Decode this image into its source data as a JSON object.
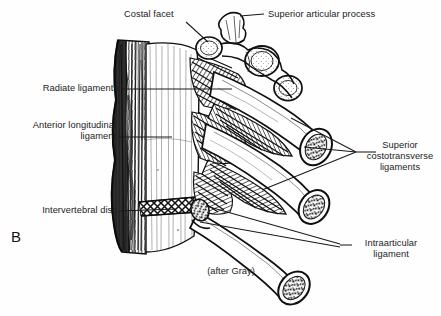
{
  "figure": {
    "panel_letter": "B",
    "credit": "(after Gray)",
    "type": "anatomical-line-illustration"
  },
  "labels": {
    "costal_facet": "Costal facet",
    "superior_articular_process": "Superior articular process",
    "radiate_ligaments": "Radiate ligaments",
    "anterior_longitudinal_ligament": "Anterior longitudinal\nligament",
    "intervertebral_disc": "Intervertebral disc",
    "superior_costotransverse_ligaments": "Superior\ncostotransverse\nligaments",
    "intraarticular_ligament": "Intraarticular\nligament"
  },
  "colors": {
    "ink": "#111111",
    "paper": "#fefefe",
    "leader": "#1a1a1a"
  }
}
